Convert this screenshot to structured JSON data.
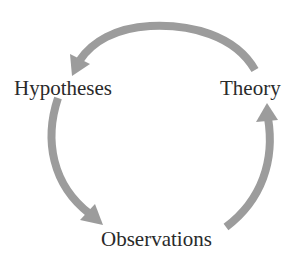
{
  "diagram": {
    "type": "cycle",
    "nodes": [
      {
        "id": "hypotheses",
        "label": "Hypotheses"
      },
      {
        "id": "theory",
        "label": "Theory"
      },
      {
        "id": "observations",
        "label": "Observations"
      }
    ],
    "edges": [
      {
        "from": "theory",
        "to": "hypotheses"
      },
      {
        "from": "hypotheses",
        "to": "observations"
      },
      {
        "from": "observations",
        "to": "theory"
      }
    ],
    "colors": {
      "arrow": "#9a9a9a",
      "text": "#2a2a2a",
      "background": "#ffffff"
    }
  }
}
